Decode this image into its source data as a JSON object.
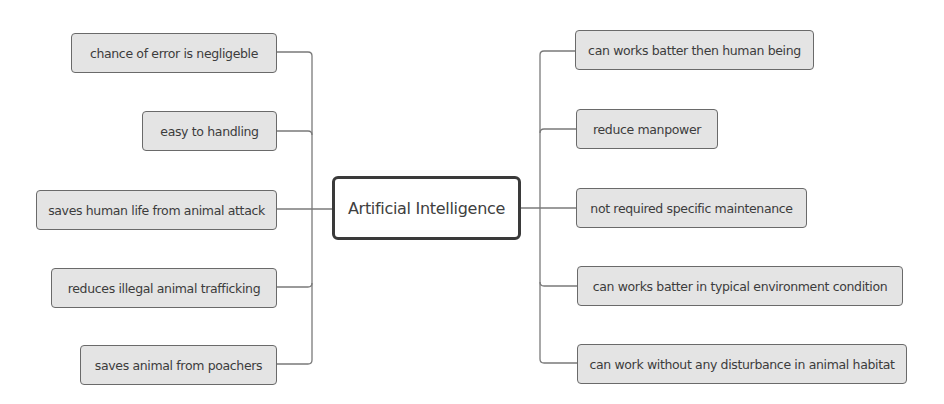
{
  "diagram": {
    "type": "mind-map",
    "central_topic": "Artificial Intelligence",
    "left_branches": [
      {
        "label": "chance of error is negligeble"
      },
      {
        "label": "easy to handling"
      },
      {
        "label": "saves human life from animal attack"
      },
      {
        "label": "reduces illegal animal trafficking"
      },
      {
        "label": "saves animal from poachers"
      }
    ],
    "right_branches": [
      {
        "label": "can works batter then human being"
      },
      {
        "label": "reduce manpower"
      },
      {
        "label": "not required specific maintenance"
      },
      {
        "label": "can works batter in typical environment condition"
      },
      {
        "label": "can work without any disturbance in animal habitat"
      }
    ],
    "colors": {
      "node_fill": "#e4e4e4",
      "node_border": "#6a6a6a",
      "center_border": "#3a3a3a",
      "connector": "#7a7a7a",
      "text": "#3c3c3c"
    }
  }
}
